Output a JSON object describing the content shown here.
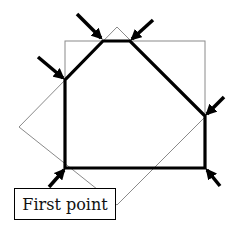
{
  "label": {
    "text": "First point"
  },
  "colors": {
    "background": "#ffffff",
    "polygon_stroke": "#000000",
    "guide_stroke": "#8a8a8a",
    "arrow_fill": "#000000"
  },
  "shapes": {
    "bounding_rectangle": {
      "x1": 65,
      "y1": 41,
      "x2": 205,
      "y2": 168
    },
    "rotated_square": [
      [
        117,
        27
      ],
      [
        206,
        116
      ],
      [
        117,
        205
      ],
      [
        19,
        127
      ]
    ],
    "polygon_vertices": [
      [
        65,
        168
      ],
      [
        65,
        80
      ],
      [
        103,
        41
      ],
      [
        130,
        41
      ],
      [
        205,
        116
      ],
      [
        205,
        168
      ]
    ]
  },
  "arrows": [
    {
      "from": [
        49,
        187
      ],
      "to": [
        64,
        170
      ],
      "target": "first-point-vertex"
    },
    {
      "from": [
        38,
        57
      ],
      "to": [
        63,
        78
      ],
      "target": "left-upper-vertex"
    },
    {
      "from": [
        77,
        14
      ],
      "to": [
        101,
        38
      ],
      "target": "top-left-vertex"
    },
    {
      "from": [
        153,
        20
      ],
      "to": [
        132,
        39
      ],
      "target": "top-right-vertex"
    },
    {
      "from": [
        224,
        97
      ],
      "to": [
        207,
        114
      ],
      "target": "right-upper-vertex"
    },
    {
      "from": [
        220,
        186
      ],
      "to": [
        207,
        170
      ],
      "target": "bottom-right-vertex"
    }
  ]
}
